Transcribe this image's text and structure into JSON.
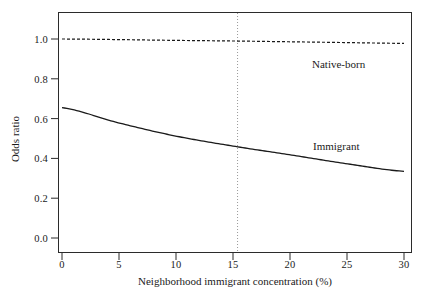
{
  "chart_data": {
    "type": "line",
    "title": "",
    "xlabel": "Neighborhood immigrant concentration (%)",
    "ylabel": "Odds ratio",
    "xlim": [
      -1.0,
      31.0
    ],
    "ylim": [
      -0.06,
      1.11
    ],
    "xticks": [
      "0",
      "5",
      "10",
      "15",
      "20",
      "25",
      "30"
    ],
    "xtick_values": [
      0,
      5,
      10,
      15,
      20,
      25,
      30
    ],
    "yticks": [
      "0.0",
      "0.2",
      "0.4",
      "0.6",
      "0.8",
      "1.0"
    ],
    "ytick_values": [
      0.0,
      0.2,
      0.4,
      0.6,
      0.8,
      1.0
    ],
    "grid": false,
    "legend_position": "inline-annotations",
    "series": [
      {
        "name": "Native-born",
        "style": "dashed",
        "color": "#1a1a1a",
        "x": [
          0,
          5,
          10,
          15,
          20,
          25,
          30
        ],
        "values": [
          1.0,
          0.997,
          0.993,
          0.99,
          0.986,
          0.982,
          0.978
        ]
      },
      {
        "name": "Immigrant",
        "style": "solid",
        "color": "#1a1a1a",
        "x": [
          0,
          5,
          10,
          15,
          20,
          25,
          30
        ],
        "values": [
          0.655,
          0.578,
          0.512,
          0.462,
          0.418,
          0.373,
          0.335
        ]
      }
    ],
    "annotations": [
      {
        "name": "native-born-label",
        "text": "Native-born",
        "x": 22.5,
        "y": 0.9
      },
      {
        "name": "immigrant-label",
        "text": "Immigrant",
        "x": 22.6,
        "y": 0.48
      }
    ],
    "reference_lines": [
      {
        "name": "mean-concentration",
        "orientation": "vertical",
        "x": 15.4,
        "style": "dotted",
        "color": "#9a9a9a"
      }
    ]
  }
}
